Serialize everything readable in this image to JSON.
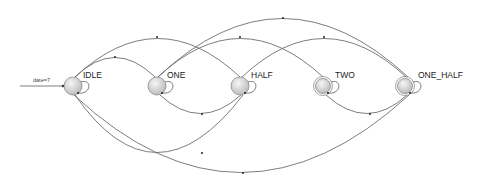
{
  "diagram": {
    "type": "state-machine",
    "initial_transition": {
      "label": "date=7",
      "target": "IDLE"
    },
    "states": [
      {
        "id": "IDLE",
        "label": "IDLE",
        "accepting": false,
        "cx": 73,
        "cy": 86
      },
      {
        "id": "ONE",
        "label": "ONE",
        "accepting": false,
        "cx": 157,
        "cy": 86
      },
      {
        "id": "HALF",
        "label": "HALF",
        "accepting": false,
        "cx": 240,
        "cy": 86
      },
      {
        "id": "TWO",
        "label": "TWO",
        "accepting": true,
        "cx": 323,
        "cy": 86
      },
      {
        "id": "ONE_HALF",
        "label": "ONE_HALF",
        "accepting": true,
        "cx": 405,
        "cy": 86
      }
    ],
    "transitions": [
      {
        "from": "IDLE",
        "to": "IDLE",
        "kind": "self-loop"
      },
      {
        "from": "ONE",
        "to": "ONE",
        "kind": "self-loop"
      },
      {
        "from": "HALF",
        "to": "HALF",
        "kind": "self-loop"
      },
      {
        "from": "TWO",
        "to": "TWO",
        "kind": "self-loop"
      },
      {
        "from": "ONE_HALF",
        "to": "ONE_HALF",
        "kind": "self-loop"
      },
      {
        "from": "IDLE",
        "to": "ONE",
        "kind": "upper-arc"
      },
      {
        "from": "IDLE",
        "to": "HALF",
        "kind": "upper-arc"
      },
      {
        "from": "ONE",
        "to": "TWO",
        "kind": "upper-arc"
      },
      {
        "from": "HALF",
        "to": "ONE_HALF",
        "kind": "upper-arc"
      },
      {
        "from": "ONE",
        "to": "ONE_HALF",
        "kind": "upper-arc"
      },
      {
        "from": "ONE",
        "to": "HALF",
        "kind": "lower-arc"
      },
      {
        "from": "TWO",
        "to": "ONE_HALF",
        "kind": "lower-arc"
      },
      {
        "from": "HALF",
        "to": "IDLE",
        "kind": "lower-arc"
      },
      {
        "from": "ONE_HALF",
        "to": "IDLE",
        "kind": "lower-arc"
      }
    ],
    "colors": {
      "edge": "#6e6e6e",
      "node_fill_center": "#f4f4f4",
      "node_fill_edge": "#bdbdbd",
      "node_stroke": "#8a8a8a"
    }
  }
}
